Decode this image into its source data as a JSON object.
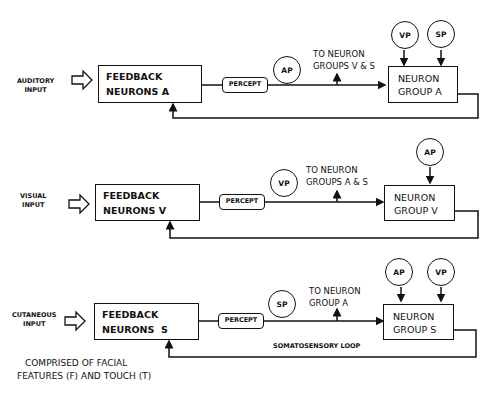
{
  "rows": [
    {
      "input_label": [
        "AUDITORY",
        "INPUT"
      ],
      "feedback_box": "FEEDBACK\nNEURONS A",
      "percept_label": "PERCEPT",
      "percept_circle": "AP",
      "to_label": [
        "TO NEURON",
        "GROUPS V & S"
      ],
      "group_box": "NEURON\nGROUP A",
      "inputs": [
        "VP",
        "SP"
      ]
    },
    {
      "input_label": [
        "VISUAL",
        "INPUT"
      ],
      "feedback_box": "FEEDBACK\nNEURONS V",
      "percept_label": "PERCEPT",
      "percept_circle": "VP",
      "to_label": [
        "TO NEURON",
        "GROUPS A & S"
      ],
      "group_box": "NEURON\nGROUP V",
      "inputs": [
        "AP"
      ]
    },
    {
      "input_label": [
        "CUTANEOUS",
        "INPUT"
      ],
      "feedback_box": "FEEDBACK\nNEURONS  S",
      "percept_label": "PERCEPT",
      "percept_circle": "SP",
      "to_label": [
        "TO  NEURON",
        "GROUP A"
      ],
      "group_box": "NEURON\nGROUP S",
      "inputs": [
        "AP",
        "VP"
      ],
      "loop_label": "SOMATOSENSORY LOOP"
    }
  ],
  "note": [
    "COMPRISED OF FACIAL",
    "FEATURES (F) AND TOUCH (T)"
  ]
}
